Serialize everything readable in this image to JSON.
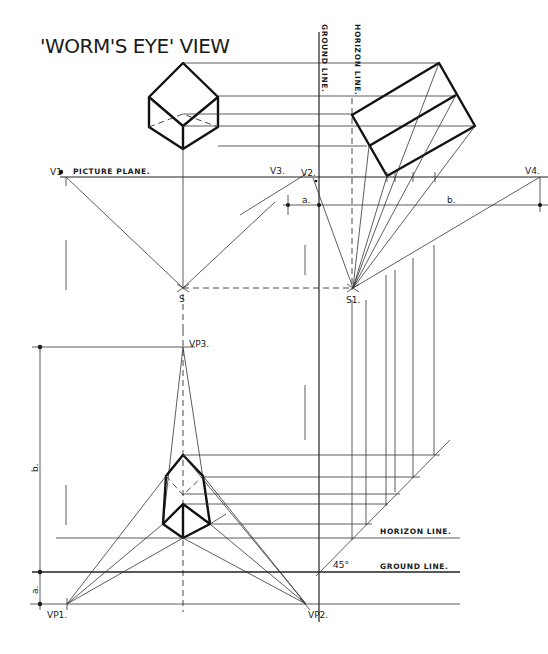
{
  "title": "'WORM'S EYE' VIEW",
  "labels": {
    "picture_plane": "PICTURE PLANE.",
    "ground_line_vertical": "GROUND LINE.",
    "horizon_line_vertical": "HORIZON LINE.",
    "horizon_line": "HORIZON LINE.",
    "ground_line": "GROUND LINE.",
    "v1": "V1",
    "v2": "V2.",
    "v3": "V3.",
    "v4": "V4.",
    "s": "S",
    "s1": "S1.",
    "a_top": "a.",
    "b_top": "b.",
    "vp1": "VP1.",
    "vp2": "VP2.",
    "vp3": "VP3.",
    "a_side": "a.",
    "b_side": "b.",
    "angle": "45°"
  },
  "colors": {
    "ink": "#111111",
    "paper": "#ffffff"
  }
}
